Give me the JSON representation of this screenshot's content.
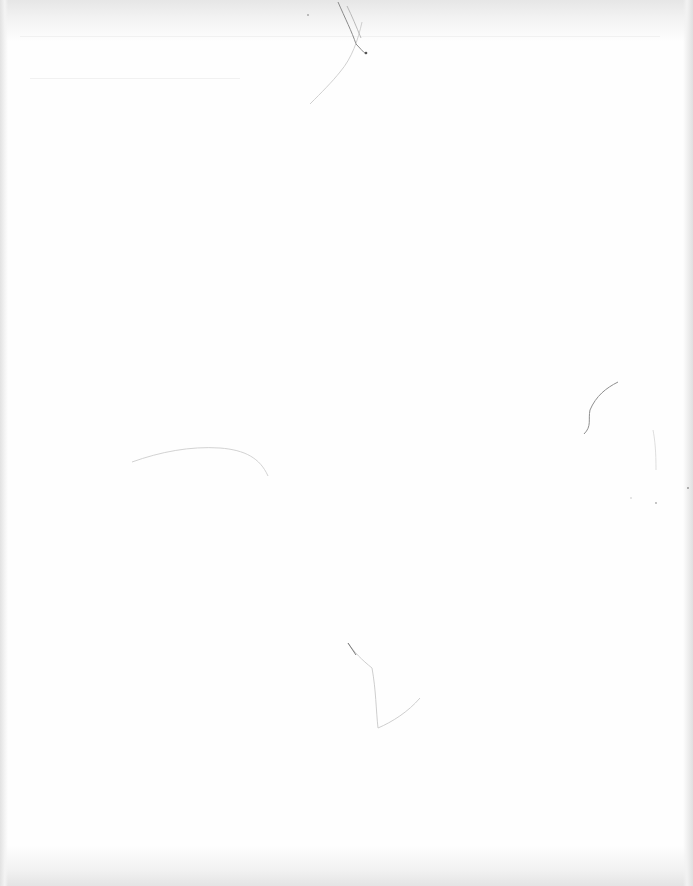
{
  "document": {
    "type": "blank-scanned-page",
    "text_content": "",
    "page_color": "#fefefe",
    "scan_edge_color": "#e4e4e4",
    "artifact_color": "#9a9a9a"
  }
}
